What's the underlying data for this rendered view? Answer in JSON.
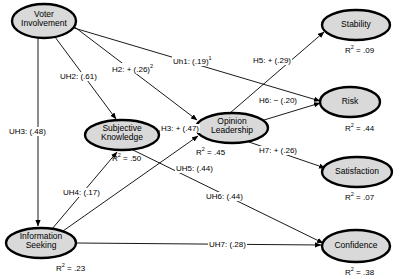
{
  "diagram": {
    "type": "path-diagram",
    "node_fill": "#d9d9d9",
    "node_stroke": "#000000",
    "edge_stroke": "#000000",
    "background": "#ffffff"
  },
  "nodes": [
    {
      "id": "voter-involvement",
      "label": "Voter\nInvolvement",
      "cx": 44,
      "cy": 21,
      "rx": 32,
      "ry": 17,
      "r2": null
    },
    {
      "id": "subjective-knowledge",
      "label": "Subjective\nKnowledge",
      "cx": 122,
      "cy": 135,
      "rx": 37,
      "ry": 15,
      "r2": ".50",
      "r2_x": 112,
      "r2_y": 152
    },
    {
      "id": "information-seeking",
      "label": "Information\nSeeking",
      "cx": 41,
      "cy": 243,
      "rx": 35,
      "ry": 15,
      "r2": ".23",
      "r2_x": 56,
      "r2_y": 262
    },
    {
      "id": "opinion-leadership",
      "label": "Opinion\nLeadership",
      "cx": 232,
      "cy": 128,
      "rx": 36,
      "ry": 15,
      "r2": ".45",
      "r2_x": 196,
      "r2_y": 146
    },
    {
      "id": "stability",
      "label": "Stability",
      "cx": 356,
      "cy": 25,
      "rx": 34,
      "ry": 15,
      "r2": ".09",
      "r2_x": 345,
      "r2_y": 44
    },
    {
      "id": "risk",
      "label": "Risk",
      "cx": 350,
      "cy": 102,
      "rx": 30,
      "ry": 15,
      "r2": ".44",
      "r2_x": 345,
      "r2_y": 122
    },
    {
      "id": "satisfaction",
      "label": "Satisfaction",
      "cx": 357,
      "cy": 172,
      "rx": 35,
      "ry": 15,
      "r2": ".07",
      "r2_x": 345,
      "r2_y": 191
    },
    {
      "id": "confidence",
      "label": "Confidence",
      "cx": 356,
      "cy": 246,
      "rx": 34,
      "ry": 16,
      "r2": ".38",
      "r2_x": 345,
      "r2_y": 266
    }
  ],
  "r2_symbol": "R",
  "r2_exponent": "2",
  "r2_equals": " = ",
  "paths": [
    {
      "id": "uh2",
      "label": "UH2: (.61)",
      "sup": "",
      "x": 59,
      "y": 72,
      "from": "voter-involvement",
      "to": "subjective-knowledge"
    },
    {
      "id": "uh3",
      "label": "UH3: (.48)",
      "sup": "",
      "x": 8,
      "y": 127,
      "from": "voter-involvement",
      "to": "information-seeking"
    },
    {
      "id": "uh4",
      "label": "UH4: (.17)",
      "sup": "",
      "x": 62,
      "y": 188,
      "from": "information-seeking",
      "to": "subjective-knowledge"
    },
    {
      "id": "uh5",
      "label": "UH5: (.44)",
      "sup": "",
      "x": 175,
      "y": 164,
      "from": "information-seeking",
      "to": "opinion-leadership"
    },
    {
      "id": "uh6",
      "label": "UH6: (.44)",
      "sup": "",
      "x": 205,
      "y": 192,
      "from": "subjective-knowledge",
      "to": "confidence"
    },
    {
      "id": "uh7",
      "label": "UH7: (.28)",
      "sup": "",
      "x": 208,
      "y": 240,
      "from": "information-seeking",
      "to": "confidence"
    },
    {
      "id": "uh1",
      "label": "Uh1: (.19)",
      "sup": "1",
      "x": 172,
      "y": 55,
      "from": "voter-involvement",
      "to": "risk"
    },
    {
      "id": "h2",
      "label": "H2: + (.26)",
      "sup": "2",
      "x": 111,
      "y": 63,
      "from": "voter-involvement",
      "to": "opinion-leadership"
    },
    {
      "id": "h3",
      "label": "H3: + (.47)",
      "sup": "",
      "x": 160,
      "y": 124,
      "from": "subjective-knowledge",
      "to": "opinion-leadership"
    },
    {
      "id": "h5",
      "label": "H5: + (.29)",
      "sup": "",
      "x": 252,
      "y": 56,
      "from": "opinion-leadership",
      "to": "stability"
    },
    {
      "id": "h6",
      "label": "H6: − (.20)",
      "sup": "",
      "x": 258,
      "y": 96,
      "from": "opinion-leadership",
      "to": "risk"
    },
    {
      "id": "h7",
      "label": "H7: + (.26)",
      "sup": "",
      "x": 258,
      "y": 146,
      "from": "opinion-leadership",
      "to": "satisfaction"
    }
  ]
}
